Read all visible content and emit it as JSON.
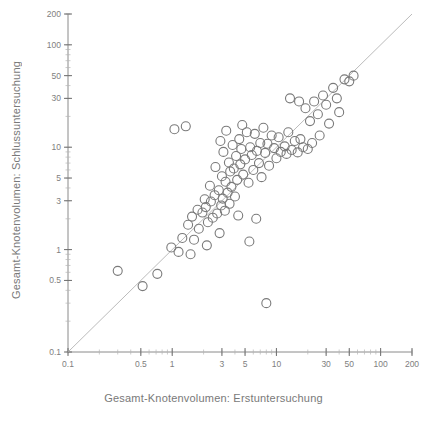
{
  "figure": {
    "kind": "scatter-plot",
    "background_color": "#ffffff",
    "ink_color": "#6e6e6e",
    "marker_color": "#7a7a7a",
    "reference_line_color": "#a9a9a9"
  },
  "axes": {
    "x_title": "Gesamt-Knotenvolumen: Erstuntersuchung",
    "y_title": "Gesamt-Knotenvolumen: Schlussuntersuchung",
    "x_tick_labels": [
      "0.1",
      "0.5",
      "1",
      "3",
      "5",
      "10",
      "30",
      "50",
      "100",
      "200"
    ],
    "y_tick_labels": [
      "0.1",
      "0.5",
      "1",
      "3",
      "5",
      "10",
      "30",
      "50",
      "100",
      "200"
    ]
  },
  "chart_data": {
    "type": "scatter",
    "title": "",
    "xlabel": "Gesamt-Knotenvolumen: Erstuntersuchung",
    "ylabel": "Gesamt-Knotenvolumen: Schlussuntersuchung",
    "xscale": "log",
    "yscale": "log",
    "xlim": [
      0.1,
      200
    ],
    "ylim": [
      0.1,
      200
    ],
    "grid": false,
    "legend": null,
    "x_ticks": [
      0.1,
      0.5,
      1,
      3,
      5,
      10,
      30,
      50,
      100,
      200
    ],
    "y_ticks": [
      0.1,
      0.5,
      1,
      3,
      5,
      10,
      30,
      50,
      100,
      200
    ],
    "annotations": [
      {
        "name": "identity-line",
        "type": "reference_line",
        "description": "Diagonale y = x",
        "from": [
          0.1,
          0.1
        ],
        "to": [
          200,
          200
        ]
      }
    ],
    "marker": {
      "style": "open-circle",
      "size_px": 9,
      "edge_color": "#7a7a7a",
      "fill": "none"
    },
    "series": [
      {
        "name": "Patienten",
        "points": [
          [
            0.3,
            0.62
          ],
          [
            0.52,
            0.44
          ],
          [
            0.72,
            0.58
          ],
          [
            0.98,
            1.05
          ],
          [
            1.05,
            15.0
          ],
          [
            1.25,
            1.3
          ],
          [
            1.42,
            1.75
          ],
          [
            1.55,
            2.1
          ],
          [
            1.62,
            1.25
          ],
          [
            1.75,
            2.45
          ],
          [
            1.8,
            1.6
          ],
          [
            1.95,
            2.3
          ],
          [
            2.05,
            3.1
          ],
          [
            2.1,
            2.6
          ],
          [
            2.2,
            1.85
          ],
          [
            2.3,
            4.2
          ],
          [
            2.35,
            2.95
          ],
          [
            2.45,
            2.05
          ],
          [
            2.55,
            3.4
          ],
          [
            2.6,
            6.4
          ],
          [
            2.7,
            2.25
          ],
          [
            2.8,
            3.8
          ],
          [
            2.85,
            1.45
          ],
          [
            2.95,
            2.7
          ],
          [
            3.0,
            5.2
          ],
          [
            3.05,
            3.15
          ],
          [
            3.1,
            9.0
          ],
          [
            3.2,
            2.4
          ],
          [
            3.25,
            4.6
          ],
          [
            3.3,
            14.5
          ],
          [
            3.4,
            3.6
          ],
          [
            3.5,
            7.1
          ],
          [
            3.55,
            2.8
          ],
          [
            3.6,
            5.8
          ],
          [
            3.7,
            4.1
          ],
          [
            3.8,
            10.5
          ],
          [
            3.9,
            6.2
          ],
          [
            4.0,
            3.3
          ],
          [
            4.1,
            8.2
          ],
          [
            4.2,
            4.8
          ],
          [
            4.3,
            2.15
          ],
          [
            4.4,
            12.0
          ],
          [
            4.5,
            6.8
          ],
          [
            4.6,
            9.6
          ],
          [
            4.8,
            5.4
          ],
          [
            5.0,
            7.6
          ],
          [
            5.2,
            14.0
          ],
          [
            5.4,
            4.5
          ],
          [
            5.6,
            10.0
          ],
          [
            5.8,
            8.4
          ],
          [
            6.0,
            6.0
          ],
          [
            6.2,
            13.5
          ],
          [
            6.5,
            9.2
          ],
          [
            6.8,
            7.0
          ],
          [
            7.0,
            11.0
          ],
          [
            7.2,
            5.1
          ],
          [
            7.5,
            15.5
          ],
          [
            7.8,
            8.8
          ],
          [
            8.0,
            0.3
          ],
          [
            8.2,
            10.8
          ],
          [
            8.5,
            6.6
          ],
          [
            9.0,
            13.0
          ],
          [
            9.5,
            9.8
          ],
          [
            10.0,
            7.8
          ],
          [
            10.5,
            12.5
          ],
          [
            11.0,
            9.0
          ],
          [
            12.0,
            10.2
          ],
          [
            12.5,
            8.6
          ],
          [
            13.0,
            14.0
          ],
          [
            14.0,
            9.4
          ],
          [
            15.0,
            11.5
          ],
          [
            16.0,
            8.9
          ],
          [
            17.0,
            12.0
          ],
          [
            18.0,
            10.0
          ],
          [
            19.0,
            24.0
          ],
          [
            20.0,
            9.6
          ],
          [
            21.0,
            18.0
          ],
          [
            22.0,
            11.0
          ],
          [
            23.0,
            28.0
          ],
          [
            25.0,
            21.0
          ],
          [
            26.0,
            13.0
          ],
          [
            28.0,
            32.0
          ],
          [
            30.0,
            26.0
          ],
          [
            32.0,
            17.0
          ],
          [
            35.0,
            38.0
          ],
          [
            38.0,
            30.0
          ],
          [
            40.0,
            22.0
          ],
          [
            45.0,
            46.0
          ],
          [
            50.0,
            44.0
          ],
          [
            55.0,
            50.0
          ],
          [
            1.35,
            16.0
          ],
          [
            2.15,
            1.1
          ],
          [
            5.5,
            1.2
          ],
          [
            2.9,
            11.5
          ],
          [
            4.7,
            16.5
          ],
          [
            6.4,
            2.0
          ],
          [
            1.15,
            0.95
          ],
          [
            1.5,
            0.9
          ],
          [
            13.5,
            30.0
          ],
          [
            16.5,
            28.0
          ]
        ]
      }
    ]
  }
}
